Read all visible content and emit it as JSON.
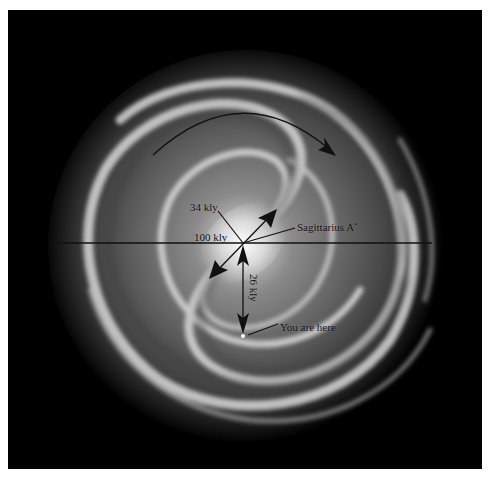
{
  "figure": {
    "background_color": "#000000",
    "frame_color": "#ffffff"
  },
  "labels": {
    "radius_label": "34 kly",
    "diameter_label": "100 kly",
    "center_label": "Sagittarius A",
    "center_label_superscript": "*",
    "sun_distance_label": "26 kly",
    "sun_label": "You are here"
  },
  "annotations": {
    "rotation_arrow": "clockwise-rotation-arrow",
    "diameter_line": "horizontal-diameter-line",
    "diagonal_arrow": "double-headed-diagonal-arrow",
    "sun_distance_arrow": "double-headed-vertical-arrow",
    "sun_marker": "sun-position-dot"
  }
}
